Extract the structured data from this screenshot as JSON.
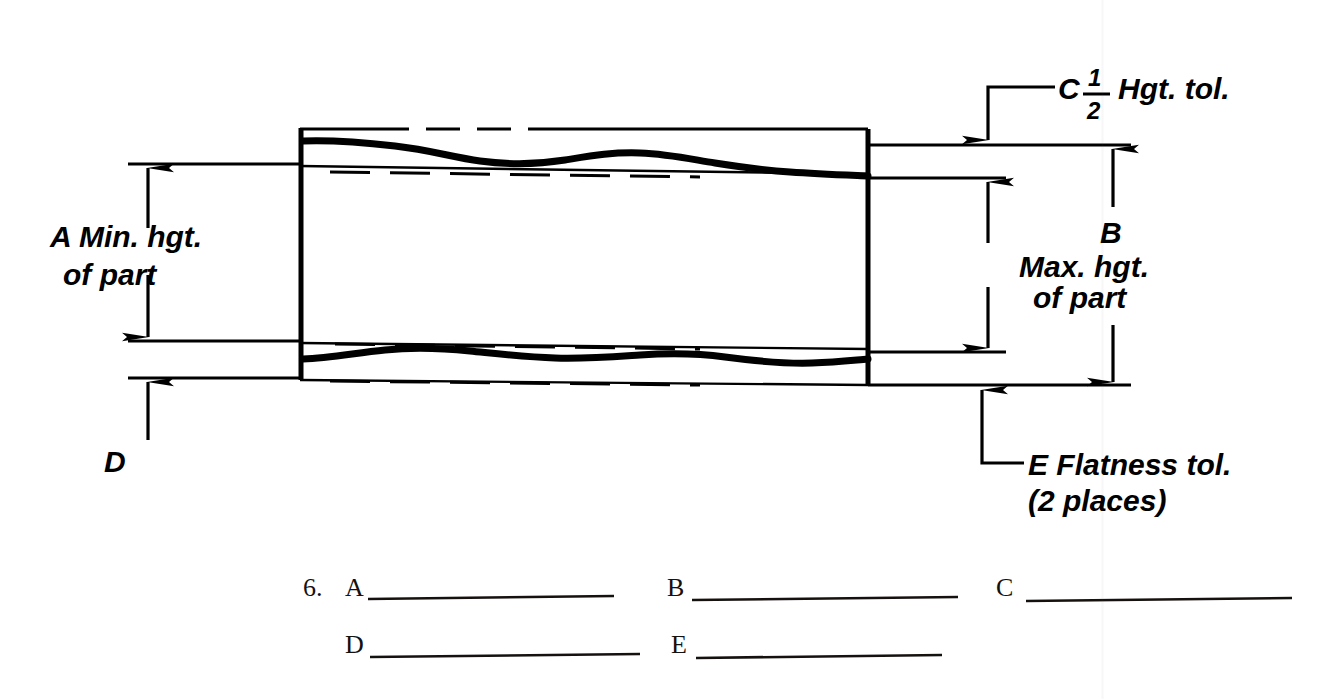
{
  "page": {
    "width": 1343,
    "height": 699,
    "background": "#ffffff",
    "ink_color": "#000000",
    "answer_ink_color": "#15110f"
  },
  "figure": {
    "type": "engineering-drawing",
    "labels": {
      "a": {
        "key": "A",
        "line1": "A Min. hgt.",
        "line2": "of part",
        "full": "A Min. hgt. of part"
      },
      "b": {
        "key": "B",
        "line1": "B",
        "line2": "Max. hgt.",
        "line3": "of part",
        "full": "B Max. hgt. of part"
      },
      "c": {
        "key": "C",
        "prefix": "C",
        "fraction_numerator": "1",
        "fraction_denominator": "2",
        "suffix": "Hgt. tol.",
        "full": "C 1/2 Hgt. tol."
      },
      "d": {
        "key": "D",
        "full": "D"
      },
      "e": {
        "key": "E",
        "line1": "E Flatness tol.",
        "line2": "(2 places)",
        "full": "E Flatness tol. (2 places)"
      }
    }
  },
  "answers": {
    "question_number": "6.",
    "rows": [
      [
        {
          "label": "A",
          "value": "",
          "blank_width": 246
        },
        {
          "label": "B",
          "value": "",
          "blank_width": 246
        },
        {
          "label": "C",
          "value": "",
          "blank_width": 246
        }
      ],
      [
        {
          "label": "D",
          "value": "",
          "blank_width": 246
        },
        {
          "label": "E",
          "value": "",
          "blank_width": 246
        }
      ]
    ]
  }
}
